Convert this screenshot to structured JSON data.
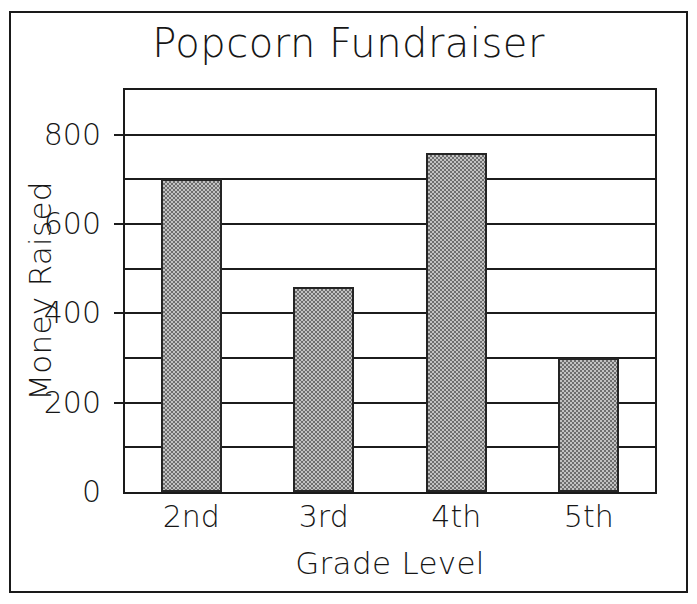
{
  "chart_data": {
    "type": "bar",
    "title": "Popcorn Fundraiser",
    "xlabel": "Grade Level",
    "ylabel": "Money Raised",
    "categories": [
      "2nd",
      "3rd",
      "4th",
      "5th"
    ],
    "values": [
      700,
      460,
      760,
      300
    ],
    "ylim": [
      0,
      900
    ],
    "ytick_labels": [
      "0",
      "200",
      "400",
      "600",
      "800"
    ],
    "ytick_values": [
      0,
      200,
      400,
      600,
      800
    ],
    "gridline_values": [
      100,
      200,
      300,
      400,
      500,
      600,
      700,
      800
    ],
    "grid": true,
    "legend": "none",
    "bar_fill_color": "#8a8a8a",
    "bar_edge_color": "#242424",
    "axis_color": "#1c1c1c",
    "background_color": "#ffffff"
  },
  "frame": {
    "border_color": "#1a1a1a"
  }
}
